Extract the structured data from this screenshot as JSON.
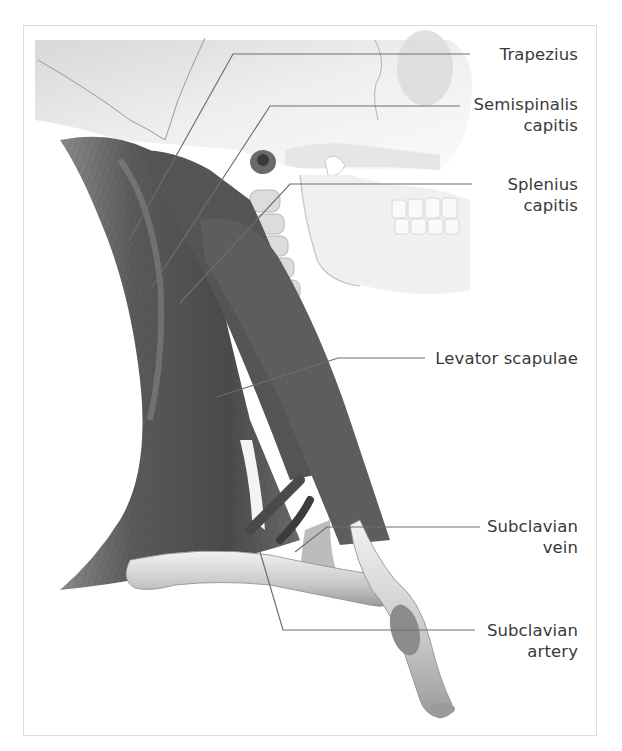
{
  "figure": {
    "style": "grayscale anatomical illustration",
    "regions": [
      "skull",
      "mandible",
      "cervical-vertebrae",
      "neck-muscles",
      "clavicle",
      "first-rib"
    ]
  },
  "labels": [
    {
      "id": "trapezius",
      "lines": [
        "Trapezius"
      ]
    },
    {
      "id": "semispinalis-capitis",
      "lines": [
        "Semispinalis",
        "capitis"
      ]
    },
    {
      "id": "splenius-capitis",
      "lines": [
        "Splenius",
        "capitis"
      ]
    },
    {
      "id": "levator-scapulae",
      "lines": [
        "Levator scapulae"
      ]
    },
    {
      "id": "subclavian-vein",
      "lines": [
        "Subclavian",
        "vein"
      ]
    },
    {
      "id": "subclavian-artery",
      "lines": [
        "Subclavian",
        "artery"
      ]
    }
  ],
  "colors": {
    "label_text": "#3a3a3a",
    "leader_line": "#6e6e6e",
    "frame_border": "#dcdcdc",
    "muscle_dark": "#4a4a4a",
    "muscle_mid": "#6a6a6a",
    "bone_light": "#e6e6e6"
  }
}
